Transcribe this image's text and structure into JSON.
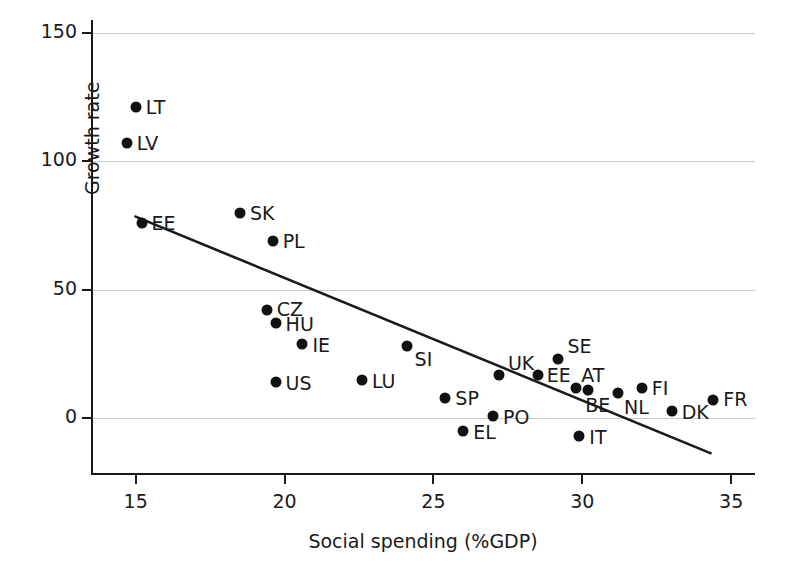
{
  "chart_data": {
    "type": "scatter",
    "title": "",
    "xlabel": "Social spending (%GDP)",
    "ylabel": "Growth rate",
    "xlim": [
      13.5,
      35.8
    ],
    "ylim": [
      -22,
      155
    ],
    "xticks": [
      15,
      20,
      25,
      30,
      35
    ],
    "yticks": [
      0,
      50,
      100,
      150
    ],
    "xtick_labels": [
      "15",
      "20",
      "25",
      "30",
      "35"
    ],
    "ytick_labels": [
      "0",
      "50",
      "100",
      "150"
    ],
    "grid": "horizontal",
    "legend": "none",
    "points": [
      {
        "label": "LT",
        "x": 15.0,
        "y": 121,
        "lx": 10,
        "ly": 0
      },
      {
        "label": "LV",
        "x": 14.7,
        "y": 107,
        "lx": 10,
        "ly": 0
      },
      {
        "label": "EE",
        "x": 15.2,
        "y": 76,
        "lx": 10,
        "ly": 0
      },
      {
        "label": "SK",
        "x": 18.5,
        "y": 80,
        "lx": 10,
        "ly": 0
      },
      {
        "label": "PL",
        "x": 19.6,
        "y": 69,
        "lx": 10,
        "ly": 0
      },
      {
        "label": "CZ",
        "x": 19.4,
        "y": 42,
        "lx": 10,
        "ly": -1
      },
      {
        "label": "HU",
        "x": 19.7,
        "y": 37,
        "lx": 10,
        "ly": 1
      },
      {
        "label": "IE",
        "x": 20.6,
        "y": 29,
        "lx": 10,
        "ly": 1
      },
      {
        "label": "US",
        "x": 19.7,
        "y": 14,
        "lx": 10,
        "ly": 1
      },
      {
        "label": "LU",
        "x": 22.6,
        "y": 15,
        "lx": 10,
        "ly": 1
      },
      {
        "label": "SI",
        "x": 24.1,
        "y": 28,
        "lx": 8,
        "ly": 13
      },
      {
        "label": "UK",
        "x": 27.2,
        "y": 17,
        "lx": 9,
        "ly": -12
      },
      {
        "label": "SE",
        "x": 29.2,
        "y": 23,
        "lx": 9,
        "ly": -13
      },
      {
        "label": "EE",
        "x": 28.5,
        "y": 17,
        "lx": 9,
        "ly": 0
      },
      {
        "label": "AT",
        "x": 29.8,
        "y": 12,
        "lx": 5,
        "ly": -13
      },
      {
        "label": "BE",
        "x": 30.2,
        "y": 11,
        "lx": -3,
        "ly": 15
      },
      {
        "label": "NL",
        "x": 31.2,
        "y": 10,
        "lx": 6,
        "ly": 14
      },
      {
        "label": "FI",
        "x": 32.0,
        "y": 12,
        "lx": 10,
        "ly": 0
      },
      {
        "label": "DK",
        "x": 33.0,
        "y": 3,
        "lx": 10,
        "ly": 1
      },
      {
        "label": "FR",
        "x": 34.4,
        "y": 7,
        "lx": 10,
        "ly": -1
      },
      {
        "label": "SP",
        "x": 25.4,
        "y": 8,
        "lx": 10,
        "ly": 0
      },
      {
        "label": "PO",
        "x": 27.0,
        "y": 1,
        "lx": 10,
        "ly": 1
      },
      {
        "label": "EL",
        "x": 26.0,
        "y": -5,
        "lx": 10,
        "ly": 1
      },
      {
        "label": "IT",
        "x": 29.9,
        "y": -7,
        "lx": 10,
        "ly": 1
      }
    ],
    "trendline": {
      "x1": 15.0,
      "y1": 78.5,
      "x2": 34.3,
      "y2": -13.5,
      "color": "#1a1a1a"
    }
  }
}
